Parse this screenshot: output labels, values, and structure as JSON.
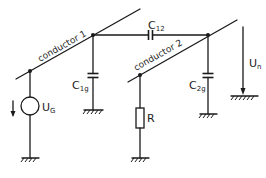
{
  "diagram": {
    "conductors": [
      {
        "id": "conductor1",
        "label": "conductor 1"
      },
      {
        "id": "conductor2",
        "label": "conductor 2"
      }
    ],
    "components": {
      "c12": {
        "type": "capacitor",
        "label_main": "C",
        "label_sub": "12"
      },
      "c1g": {
        "type": "capacitor",
        "label_main": "C",
        "label_sub": "1g"
      },
      "c2g": {
        "type": "capacitor",
        "label_main": "C",
        "label_sub": "2g"
      },
      "r": {
        "type": "resistor",
        "label": "R"
      },
      "ug": {
        "type": "voltage-source",
        "label_main": "U",
        "label_sub": "G"
      },
      "un": {
        "type": "voltage-arrow",
        "label_main": "U",
        "label_sub": "n"
      }
    },
    "colors": {
      "line": "#1a1a1a",
      "background": "#ffffff"
    }
  }
}
